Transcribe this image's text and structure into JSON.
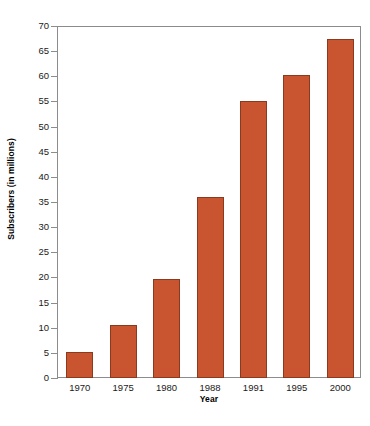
{
  "chart_data": {
    "type": "bar",
    "title": "",
    "xlabel": "Year",
    "ylabel": "Subscribers (in millions)",
    "categories": [
      "1970",
      "1975",
      "1980",
      "1988",
      "1991",
      "1995",
      "2000"
    ],
    "values": [
      5.2,
      10.5,
      19.6,
      36.0,
      55.0,
      60.2,
      67.5
    ],
    "ylim": [
      0,
      70
    ],
    "ytick_labels": [
      "0",
      "5",
      "10",
      "15",
      "20",
      "25",
      "30",
      "35",
      "40",
      "45",
      "50",
      "55",
      "60",
      "65",
      "70"
    ],
    "ytick_values": [
      0,
      5,
      10,
      15,
      20,
      25,
      30,
      35,
      40,
      45,
      50,
      55,
      60,
      65,
      70
    ],
    "grid": false,
    "legend": null,
    "bar_color": "#c8552f",
    "bar_border_color": "#8b3a1e",
    "axis_color": "#8c8c8c",
    "background_color": "#ffffff"
  }
}
